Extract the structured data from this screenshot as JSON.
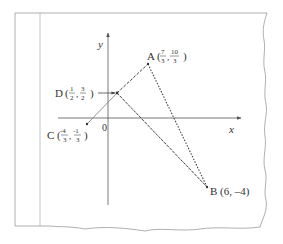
{
  "diagram": {
    "type": "coordinate-geometry",
    "axes": {
      "x_label": "x",
      "y_label": "y",
      "origin_label": "0"
    },
    "points": [
      {
        "id": "A",
        "label": "A",
        "coords": "(7/3, 10/3)",
        "x_num": "7",
        "x_den": "3",
        "y_num": "10",
        "y_den": "3"
      },
      {
        "id": "B",
        "label": "B (6, –4)",
        "coords": "(6, -4)"
      },
      {
        "id": "C",
        "label": "C",
        "coords": "(-4/3, -1/3)",
        "x_num": "-4",
        "x_den": "3",
        "y_num": "-1",
        "y_den": "3"
      },
      {
        "id": "D",
        "label": "D",
        "coords": "(1/2, 3/2)",
        "x_num": "1",
        "x_den": "2",
        "y_num": "3",
        "y_den": "2"
      }
    ],
    "segments": [
      {
        "from": "C",
        "to": "D",
        "style": "solid"
      },
      {
        "from": "D",
        "to": "A",
        "style": "dashed"
      },
      {
        "from": "A",
        "to": "B",
        "style": "dotted"
      },
      {
        "from": "D",
        "to": "B",
        "style": "dashed"
      }
    ],
    "colors": {
      "line": "#444444",
      "frame": "#999999",
      "text": "#333333"
    }
  },
  "labels": {
    "a_letter": "A",
    "a_open": "(",
    "a_xn": "7",
    "a_xd": "3",
    "a_comma": ",",
    "a_yn": "10",
    "a_yd": "3",
    "a_close": ")",
    "b_text": "B (6, –4)",
    "c_letter": "C",
    "c_open": "(",
    "c_xn": "-4",
    "c_xd": "3",
    "c_comma": ",",
    "c_yn": "-1",
    "c_yd": "3",
    "c_close": ")",
    "d_letter": "D",
    "d_open": "(",
    "d_xn": "1",
    "d_xd": "2",
    "d_comma": ",",
    "d_yn": "3",
    "d_yd": "2",
    "d_close": ")",
    "x_axis": "x",
    "y_axis": "y",
    "origin": "0"
  }
}
